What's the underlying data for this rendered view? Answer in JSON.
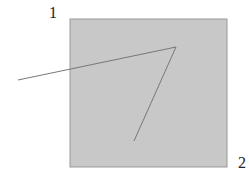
{
  "diagram": {
    "square": {
      "x": 70,
      "y": 19,
      "width": 157,
      "height": 148,
      "fill": "#c8c8c8",
      "stroke": "#999999"
    },
    "labels": [
      {
        "text": "1",
        "x": 49,
        "y": 6
      },
      {
        "text": "2",
        "x": 238,
        "y": 155
      }
    ],
    "polyline": {
      "points": [
        [
          18,
          80
        ],
        [
          176,
          47
        ],
        [
          134,
          141
        ]
      ],
      "stroke": "#777777"
    }
  }
}
